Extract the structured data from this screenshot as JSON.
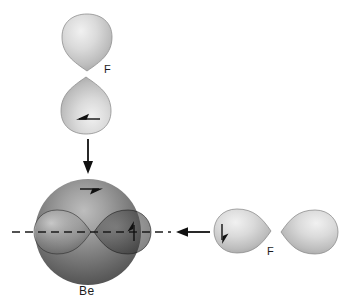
{
  "diagram": {
    "name": "orbital-overlap-diagram-BeF2",
    "labels": {
      "fluorine_top": "F",
      "fluorine_right": "F",
      "beryllium": "Be"
    },
    "colors": {
      "background": "#ffffff",
      "orbital_light_fill": "#d8d8d8",
      "orbital_outline": "#8f8f8f",
      "sphere_dark": "#4c4c4c",
      "sphere_highlight": "#bdbdbd",
      "arrow_black": "#111111",
      "dashed_axis": "#1a1a1a"
    },
    "icons": {
      "down_arrow": "down-arrow-icon",
      "left_arrow": "left-arrow-icon",
      "electron_spin_harpoon_count": "4"
    }
  }
}
